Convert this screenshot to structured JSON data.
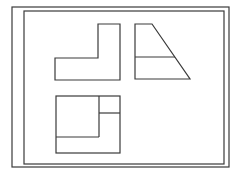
{
  "diagram": {
    "line_color": "#3a3a3a",
    "background": "#ffffff",
    "frames": {
      "outer": {
        "x": 12,
        "y": 7,
        "w": 217,
        "h": 160
      },
      "inner": {
        "x": 24,
        "y": 11,
        "w": 200,
        "h": 153
      }
    },
    "views": [
      {
        "name": "front-view",
        "shape": "L-shape"
      },
      {
        "name": "side-view",
        "shape": "trapezoid with horizontal division"
      },
      {
        "name": "top-view",
        "shape": "square with L-shaped inner division"
      }
    ]
  }
}
